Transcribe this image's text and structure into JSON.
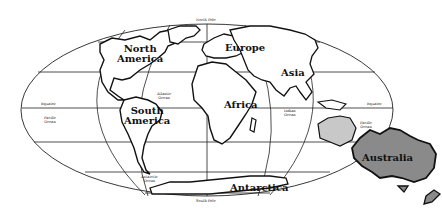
{
  "map": {
    "title": "World Map",
    "projection": "elliptical",
    "continents": {
      "north_america": [
        "North",
        "America"
      ],
      "south_america": [
        "South",
        "America"
      ],
      "europe": "Europe",
      "africa": "Africa",
      "asia": "Asia",
      "antarctica": "Antarctica",
      "australia": "Australia"
    },
    "oceans": {
      "atlantic": [
        "Atlantic",
        "Ocean"
      ],
      "pacific_left": [
        "Pacific",
        "Ocean"
      ],
      "pacific_right": [
        "Pacific",
        "Ocean"
      ],
      "indian": [
        "Indian",
        "Ocean"
      ],
      "antarctic": [
        "Antarctic",
        "Ocean"
      ]
    },
    "lines": {
      "north_pole": "North Pole",
      "south_pole": "South Pole",
      "equator_left": "Equator",
      "equator_right": "Equator"
    },
    "colors": {
      "ink": "#111111",
      "background": "#ffffff",
      "australia_fill": "#8a8a8a",
      "australia_ghost_fill": "#c8c8c8"
    }
  }
}
